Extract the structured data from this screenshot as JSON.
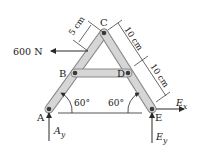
{
  "diagram": {
    "type": "A-frame truss free-body diagram",
    "points": {
      "A": "A",
      "B": "B",
      "C": "C",
      "D": "D",
      "E": "E"
    },
    "load": {
      "label": "600 N",
      "direction": "left"
    },
    "dimensions": {
      "offset_to_load": "5 cm",
      "C_to_D": "10 cm",
      "D_to_E": "10 cm"
    },
    "angles": {
      "at_A": "60°",
      "at_E": "60°"
    },
    "reactions": {
      "Ay": {
        "main": "A",
        "sub": "y"
      },
      "Ex": {
        "main": "E",
        "sub": "x"
      },
      "Ey": {
        "main": "E",
        "sub": "y"
      }
    },
    "colors": {
      "member_fill": "#d4d4d4",
      "member_stroke": "#8a8a8a",
      "line": "#2a2a2a"
    }
  }
}
